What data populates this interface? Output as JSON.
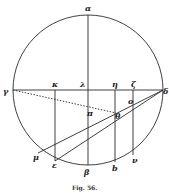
{
  "figure": {
    "caption": "Fig. 56.",
    "stroke_color": "#2a2a2a",
    "circle": {
      "cx": 88,
      "cy": 90,
      "r": 75
    },
    "labels": {
      "alpha": "α",
      "beta": "β",
      "gamma": "γ",
      "delta": "δ",
      "kappa": "κ",
      "lambda": "λ",
      "eta": "η",
      "zeta": "ζ",
      "pi": "π",
      "o": "o",
      "theta": "θ",
      "mu": "μ",
      "epsilon": "ε",
      "b": "b",
      "nu": "ν"
    }
  }
}
